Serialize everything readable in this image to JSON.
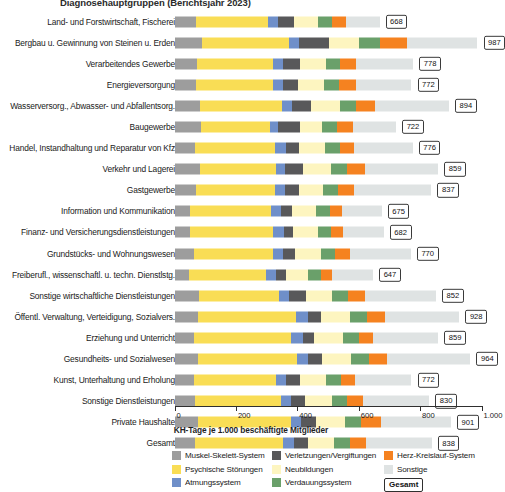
{
  "chart_data": {
    "type": "bar",
    "orientation": "horizontal",
    "stacked": true,
    "title": "Diagnosehauptgruppen (Berichtsjahr 2023)",
    "xlabel": "KH-Tage je 1.000 beschäftigte Mitglieder",
    "ylabel": "",
    "xlim": [
      0,
      1000
    ],
    "xticks": [
      0,
      200,
      400,
      600,
      800,
      1000
    ],
    "xticklabels": [
      "0",
      "200",
      "400",
      "600",
      "800",
      "1.000"
    ],
    "grid": false,
    "legend_position": "bottom",
    "categories": [
      "Land- und Forstwirtschaft, Fischerei",
      "Bergbau u. Gewinnung von Steinen u. Erden",
      "Verarbeitendes Gewerbe",
      "Energieversorgung",
      "Wasserversorg., Abwasser- und Abfallentsorg.",
      "Baugewerbe",
      "Handel, Instandhaltung und Reparatur von Kfz",
      "Verkehr und Lagerei",
      "Gastgewerbe",
      "Information und Kommunikation",
      "Finanz- und Versicherungsdienstleistungen",
      "Grundstücks- und Wohnungswesen",
      "Freiberufl., wissenschaftl. u. techn. Dienstlstg.",
      "Sonstige wirtschaftliche Dienstleistungen",
      "Öffentl. Verwaltung, Verteidigung, Sozialvers.",
      "Erziehung und Unterricht",
      "Gesundheits- und Sozialwesen",
      "Kunst, Unterhaltung und Erholung",
      "Sonstige Dienstleistungen",
      "Private Haushalte",
      "Gesamt"
    ],
    "totals": [
      668,
      987,
      778,
      772,
      894,
      722,
      776,
      859,
      837,
      675,
      682,
      770,
      647,
      852,
      928,
      859,
      964,
      772,
      830,
      901,
      838
    ],
    "series": [
      {
        "name": "Muskel-Skelett-System",
        "color": "#9d9d9d",
        "values": [
          70,
          90,
          72,
          70,
          84,
          86,
          66,
          82,
          70,
          52,
          50,
          62,
          48,
          80,
          76,
          62,
          78,
          62,
          66,
          78,
          68
        ]
      },
      {
        "name": "Psychische Störungen",
        "color": "#f9dd55",
        "values": [
          236,
          282,
          250,
          252,
          266,
          224,
          262,
          248,
          258,
          262,
          272,
          258,
          250,
          262,
          320,
          318,
          320,
          270,
          280,
          300,
          287
        ]
      },
      {
        "name": "Atmungssystem",
        "color": "#6f8fc9",
        "values": [
          30,
          34,
          32,
          32,
          34,
          28,
          34,
          30,
          32,
          34,
          34,
          32,
          32,
          32,
          38,
          40,
          38,
          32,
          34,
          34,
          34
        ]
      },
      {
        "name": "Verletzungen/Vergiftungen",
        "color": "#58585a",
        "values": [
          52,
          96,
          54,
          48,
          62,
          72,
          44,
          60,
          44,
          36,
          30,
          42,
          32,
          56,
          44,
          36,
          44,
          46,
          44,
          48,
          46
        ]
      },
      {
        "name": "Neubildungen",
        "color": "#fdf5c0",
        "values": [
          80,
          100,
          84,
          86,
          92,
          72,
          84,
          90,
          80,
          78,
          80,
          84,
          72,
          84,
          94,
          92,
          96,
          84,
          88,
          94,
          86
        ]
      },
      {
        "name": "Verdauungssystem",
        "color": "#6aa06a",
        "values": [
          44,
          68,
          48,
          48,
          54,
          46,
          48,
          52,
          50,
          44,
          44,
          46,
          42,
          50,
          56,
          52,
          58,
          48,
          50,
          54,
          50
        ]
      },
      {
        "name": "Herz-Kreislauf-System",
        "color": "#f58220",
        "values": [
          46,
          88,
          52,
          54,
          62,
          52,
          48,
          60,
          50,
          40,
          38,
          48,
          36,
          58,
          58,
          46,
          58,
          46,
          52,
          66,
          52
        ]
      },
      {
        "name": "Sonstige",
        "color": "#dfe3e3",
        "values": [
          110,
          229,
          186,
          182,
          240,
          142,
          190,
          237,
          253,
          129,
          134,
          198,
          135,
          230,
          242,
          213,
          272,
          184,
          216,
          227,
          215
        ]
      }
    ],
    "total_legend_label": "Gesamt"
  }
}
